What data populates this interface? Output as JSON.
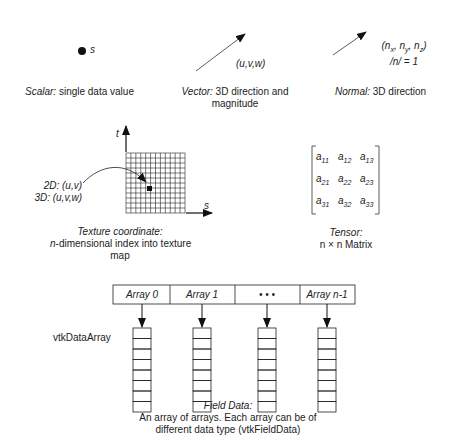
{
  "scalar": {
    "symbol": "s",
    "caption_italic": "Scalar:",
    "caption_rest": " single data value"
  },
  "vector": {
    "symbol": "(u,v,w)",
    "caption_italic": "Vector:",
    "caption_rest": " 3D direction and",
    "caption_line2": "magnitude"
  },
  "normal": {
    "symbol_line1": "(nx, ny, nz)",
    "symbol_line2": "/n/ = 1",
    "caption_italic": "Normal:",
    "caption_rest": " 3D direction"
  },
  "texture": {
    "axis_t": "t",
    "axis_s": "s",
    "label_2d": "2D: (u,v)",
    "label_3d": "3D: (u,v,w)",
    "caption_line1": "Texture coordinate:",
    "caption_line2_italic": "n",
    "caption_line2_rest": "-dimensional index into texture",
    "caption_line3": "map",
    "grid_size": 12
  },
  "tensor": {
    "matrix": [
      [
        "a11",
        "a12",
        "a13"
      ],
      [
        "a21",
        "a22",
        "a23"
      ],
      [
        "a31",
        "a32",
        "a33"
      ]
    ],
    "caption_line1": "Tensor:",
    "caption_line2": "n × n Matrix"
  },
  "field_data": {
    "arrays": [
      "Array 0",
      "Array 1",
      "• • •",
      "Array n-1"
    ],
    "side_label": "vtkDataArray",
    "caption_line1": "Field Data:",
    "caption_line2": "An array of arrays. Each array can be of",
    "caption_line3": "different data type (vtkFieldData)",
    "cells_per_array": 8
  }
}
